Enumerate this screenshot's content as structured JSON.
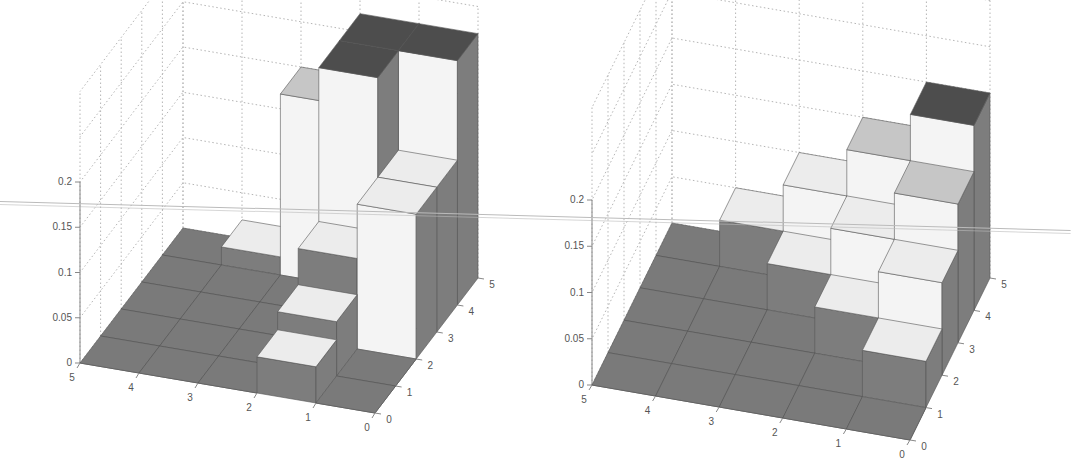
{
  "figure": {
    "panels": 2,
    "background": "#ffffff"
  },
  "colors": {
    "floor": "#7a7a7a",
    "side_dark": "#7d7d7d",
    "top_light": "#ececec",
    "top_mid": "#c6c6c6",
    "top_darkest": "#4d4d4d",
    "front_light": "#f4f4f4",
    "edge": "#555555",
    "grid": "#b5b5b5",
    "axis": "#888888"
  },
  "chart_data": [
    {
      "type": "bar3d",
      "title": "",
      "xlabel": "",
      "ylabel": "",
      "zlabel": "",
      "x_ticks": [
        "5",
        "4",
        "3",
        "2",
        "1",
        "0"
      ],
      "y_ticks": [
        "0",
        "1",
        "2",
        "3",
        "4",
        "5"
      ],
      "z_ticks": [
        "0",
        "0.05",
        "0.1",
        "0.15",
        "0.2"
      ],
      "zlim": [
        0,
        0.2
      ],
      "xlim": [
        0,
        5
      ],
      "ylim": [
        0,
        5
      ],
      "grid": true,
      "note": "heights[x][y] for cell x in 0..4 (x from 0 at right to 5 at left), y in 0..4 (front to back)",
      "heights": [
        [
          0.0,
          0.0,
          0.16,
          0.16,
          0.27
        ],
        [
          0.04,
          0.06,
          0.1,
          0.27,
          0.27
        ],
        [
          0.0,
          0.0,
          0.0,
          0.0,
          0.2
        ],
        [
          0.0,
          0.0,
          0.0,
          0.0,
          0.02
        ],
        [
          0.0,
          0.0,
          0.0,
          0.0,
          0.0
        ]
      ]
    },
    {
      "type": "bar3d",
      "title": "",
      "xlabel": "",
      "ylabel": "",
      "zlabel": "",
      "x_ticks": [
        "5",
        "4",
        "3",
        "2",
        "1",
        "0"
      ],
      "y_ticks": [
        "0",
        "1",
        "2",
        "3",
        "4",
        "5"
      ],
      "z_ticks": [
        "0",
        "0.05",
        "0.1",
        "0.15",
        "0.2"
      ],
      "zlim": [
        0,
        0.2
      ],
      "xlim": [
        0,
        5
      ],
      "ylim": [
        0,
        5
      ],
      "grid": true,
      "note": "heights[x][y] staircase distribution",
      "heights": [
        [
          0.0,
          0.05,
          0.1,
          0.15,
          0.2
        ],
        [
          0.0,
          0.0,
          0.05,
          0.1,
          0.15
        ],
        [
          0.0,
          0.0,
          0.0,
          0.05,
          0.1
        ],
        [
          0.0,
          0.0,
          0.0,
          0.0,
          0.05
        ],
        [
          0.0,
          0.0,
          0.0,
          0.0,
          0.0
        ]
      ]
    }
  ],
  "projections": [
    {
      "origin": [
        375,
        413
      ],
      "ux": [
        -59,
        -10
      ],
      "uy": [
        20.6,
        -27
      ],
      "uz": 905,
      "axis_x": 80
    },
    {
      "origin": [
        380,
        440
      ],
      "ux": [
        -63.6,
        -11
      ],
      "uy": [
        16,
        -32.4
      ],
      "uz": 925,
      "axis_x": 62
    }
  ]
}
